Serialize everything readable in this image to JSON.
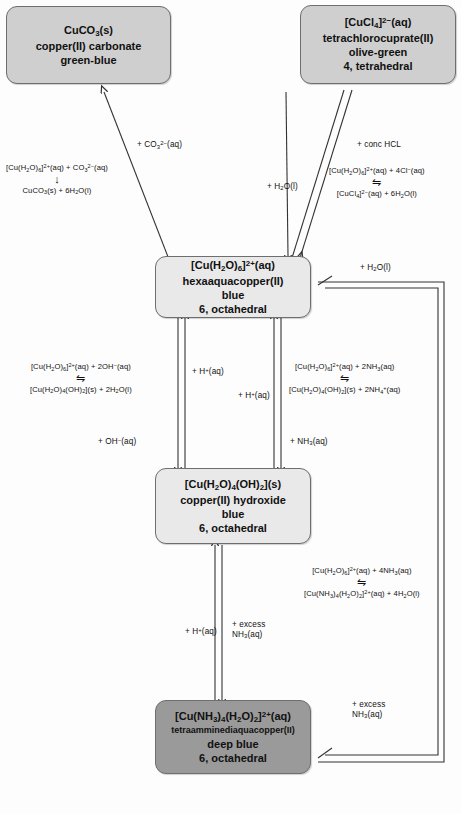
{
  "diagram": {
    "colors": {
      "node_light": "#d0d0d0",
      "node_mid": "#d7d7d7",
      "node_pale": "#e9e9e9",
      "node_dark": "#9a9a9a",
      "stroke": "#333333",
      "background": "#fdfdfd"
    }
  },
  "nodes": [
    {
      "id": "copper-carbonate",
      "formula": "CuCO₃(s)",
      "name": "copper(II) carbonate",
      "colour": "green-blue",
      "geometry": ""
    },
    {
      "id": "tetrachlorocuprate",
      "formula": "[CuCl₄]²⁻(aq)",
      "name": "tetrachlorocuprate(II)",
      "colour": "olive-green",
      "geometry": "4, tetrahedral"
    },
    {
      "id": "hexaaquacopper",
      "formula": "[Cu(H₂O)₆]²⁺(aq)",
      "name": "hexaaquacopper(II)",
      "colour": "blue",
      "geometry": "6, octahedral"
    },
    {
      "id": "copper-hydroxide",
      "formula": "[Cu(H₂O)₄(OH)₂](s)",
      "name": "copper(II) hydroxide",
      "colour": "blue",
      "geometry": "6, octahedral"
    },
    {
      "id": "tetraamminediaquacopper",
      "formula": "[Cu(NH₃)₄(H₂O)₂]²⁺(aq)",
      "name": "tetraamminediaquacopper(II)",
      "colour": "deep blue",
      "geometry": "6, octahedral"
    }
  ],
  "reagent_labels": {
    "carbonate": "+ CO₃²⁻(aq)",
    "conc_hcl": "+ conc HCL",
    "water_from_cucl4": "+ H₂O(l)",
    "water_outer_loop": "+ H₂O(l)",
    "acid_left": "+ H⁺(aq)",
    "acid_right": "+ H⁺(aq)",
    "hydroxide": "+ OH⁻(aq)",
    "ammonia": "+ NH₃(aq)",
    "acid_bottom": "+ H⁺(aq)",
    "excess_ammonia_inner": "+ excess\nNH₃(aq)",
    "excess_ammonia_outer": "+ excess\nNH₃(aq)"
  },
  "equations": [
    {
      "id": "carbonate-equation",
      "reactants": "[Cu(H₂O)₆]²⁺(aq) + CO₃²⁻(aq)",
      "arrow": "↓",
      "products": "CuCO₃(s) + 6H₂O(l)"
    },
    {
      "id": "chloride-equation",
      "reactants": "[Cu(H₂O)₆]²⁺(aq) + 4Cl⁻(aq)",
      "arrow": "⇋",
      "products": "[CuCl₄]²⁻(aq) + 6H₂O(l)"
    },
    {
      "id": "hydroxide-equation",
      "reactants": "[Cu(H₂O)₆]²⁺(aq) + 2OH⁻(aq)",
      "arrow": "⇋",
      "products": "[Cu(H₂O)₄(OH)₂](s) + 2H₂O(l)"
    },
    {
      "id": "ammonia-equation",
      "reactants": "[Cu(H₂O)₆]²⁺(aq) + 2NH₃(aq)",
      "arrow": "⇋",
      "products": "[Cu(H₂O)₄(OH)₂](s) + 2NH₄⁺(aq)"
    },
    {
      "id": "excess-ammonia-equation",
      "reactants": "[Cu(H₂O)₆]²⁺(aq) + 4NH₃(aq)",
      "arrow": "⇋",
      "products": "[Cu(NH₃)₄(H₂O)₂]²⁺(aq) + 4H₂O(l)"
    }
  ]
}
